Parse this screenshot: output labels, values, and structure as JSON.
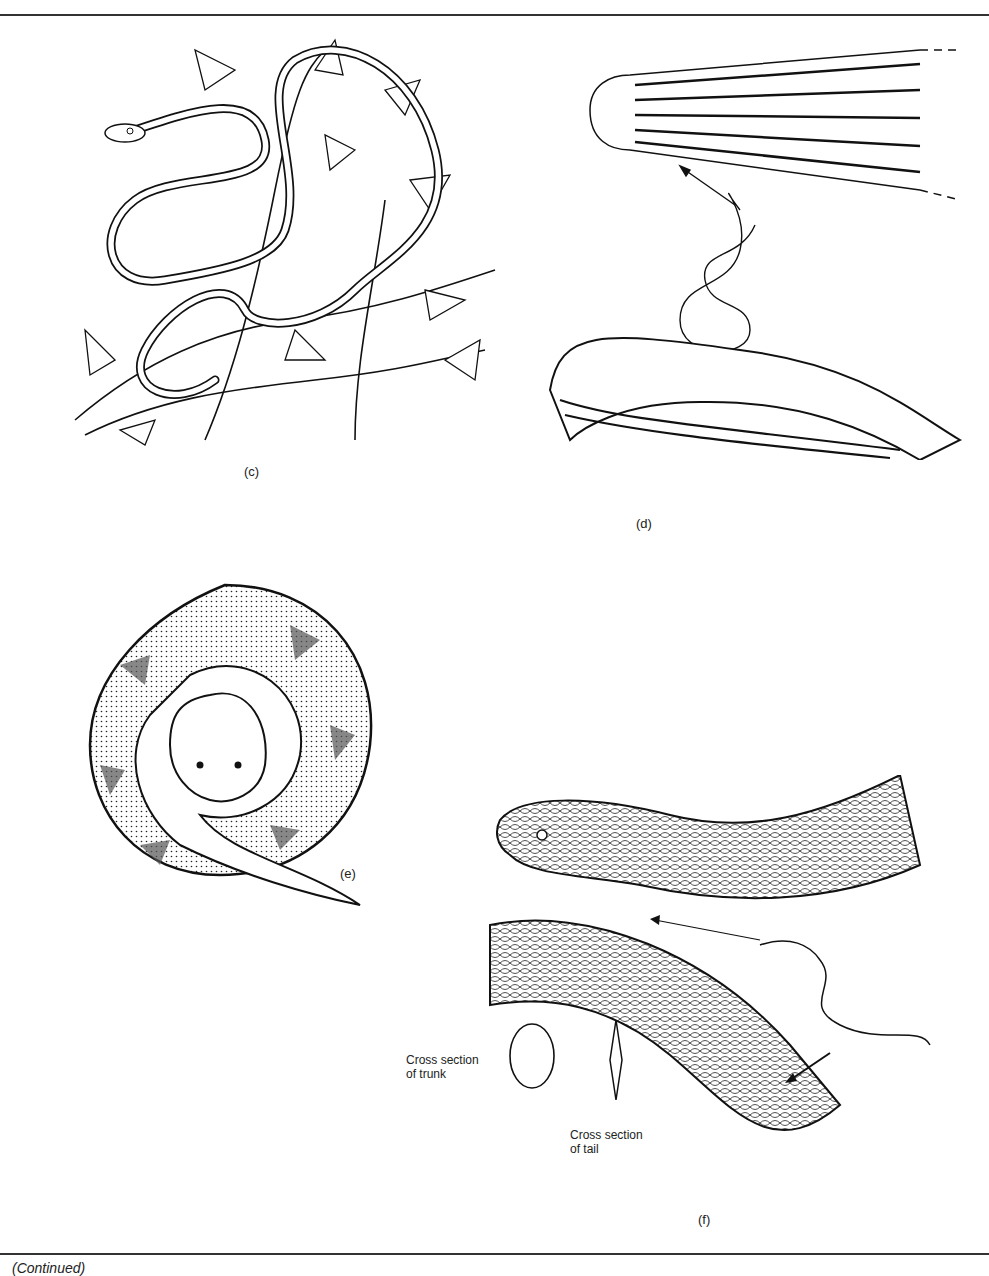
{
  "figure": {
    "panels": [
      {
        "id": "c",
        "label": "(c)",
        "subject": "arboreal vine snake coiled among leafy branches"
      },
      {
        "id": "d",
        "label": "(d)",
        "subject": "slender burrowing snake with enlarged views of striped head and body scales"
      },
      {
        "id": "e",
        "label": "(e)",
        "subject": "coiled stout viper with dotted blotch pattern"
      },
      {
        "id": "f",
        "label": "(f)",
        "subject": "sea snake with enlarged head, body scales and cross sections"
      }
    ],
    "annotations": {
      "trunk": [
        "Cross section",
        "of trunk"
      ],
      "tail": [
        "Cross section",
        "of tail"
      ]
    },
    "footer_caption": "(Continued)"
  },
  "colors": {
    "ink": "#111111",
    "paper": "#ffffff",
    "rule": "#333333"
  }
}
